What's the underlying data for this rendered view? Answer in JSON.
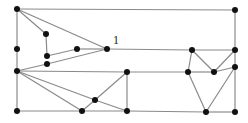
{
  "diagram": {
    "type": "planar-graph",
    "colors": {
      "edge": "#8a8a8a",
      "node": "#111111",
      "label": "#222222",
      "background": "#ffffff"
    },
    "labels": [
      {
        "id": "label-1",
        "text": "1",
        "x": 113,
        "y": 44
      }
    ],
    "nodes": [
      {
        "id": "n1",
        "x": 17,
        "y": 9
      },
      {
        "id": "n2",
        "x": 235,
        "y": 10
      },
      {
        "id": "n3",
        "x": 46,
        "y": 34
      },
      {
        "id": "n4",
        "x": 17,
        "y": 49
      },
      {
        "id": "n5",
        "x": 47,
        "y": 56
      },
      {
        "id": "n6",
        "x": 77,
        "y": 49
      },
      {
        "id": "n7",
        "x": 107,
        "y": 49
      },
      {
        "id": "n8",
        "x": 192,
        "y": 50
      },
      {
        "id": "n9",
        "x": 235,
        "y": 50
      },
      {
        "id": "n10",
        "x": 47,
        "y": 64
      },
      {
        "id": "n11",
        "x": 17,
        "y": 71
      },
      {
        "id": "n12",
        "x": 127,
        "y": 72
      },
      {
        "id": "n13",
        "x": 188,
        "y": 72
      },
      {
        "id": "n14",
        "x": 214,
        "y": 72
      },
      {
        "id": "n15",
        "x": 235,
        "y": 67
      },
      {
        "id": "n16",
        "x": 95,
        "y": 100
      },
      {
        "id": "n17",
        "x": 17,
        "y": 111
      },
      {
        "id": "n18",
        "x": 82,
        "y": 111
      },
      {
        "id": "n19",
        "x": 127,
        "y": 111
      },
      {
        "id": "n20",
        "x": 206,
        "y": 112
      },
      {
        "id": "n21",
        "x": 235,
        "y": 112
      }
    ],
    "edges": [
      [
        "n1",
        "n2"
      ],
      [
        "n1",
        "n4"
      ],
      [
        "n4",
        "n11"
      ],
      [
        "n11",
        "n17"
      ],
      [
        "n2",
        "n9"
      ],
      [
        "n9",
        "n15"
      ],
      [
        "n15",
        "n21"
      ],
      [
        "n1",
        "n3"
      ],
      [
        "n1",
        "n7"
      ],
      [
        "n3",
        "n5"
      ],
      [
        "n5",
        "n6"
      ],
      [
        "n6",
        "n7"
      ],
      [
        "n7",
        "n8"
      ],
      [
        "n8",
        "n9"
      ],
      [
        "n11",
        "n10"
      ],
      [
        "n10",
        "n7"
      ],
      [
        "n11",
        "n12"
      ],
      [
        "n12",
        "n13"
      ],
      [
        "n13",
        "n14"
      ],
      [
        "n14",
        "n15"
      ],
      [
        "n11",
        "n18"
      ],
      [
        "n11",
        "n16"
      ],
      [
        "n16",
        "n19"
      ],
      [
        "n18",
        "n16"
      ],
      [
        "n16",
        "n12"
      ],
      [
        "n12",
        "n19"
      ],
      [
        "n17",
        "n18"
      ],
      [
        "n18",
        "n19"
      ],
      [
        "n19",
        "n20"
      ],
      [
        "n20",
        "n21"
      ],
      [
        "n8",
        "n13"
      ],
      [
        "n8",
        "n14"
      ],
      [
        "n14",
        "n9"
      ],
      [
        "n13",
        "n20"
      ],
      [
        "n15",
        "n20"
      ]
    ]
  }
}
